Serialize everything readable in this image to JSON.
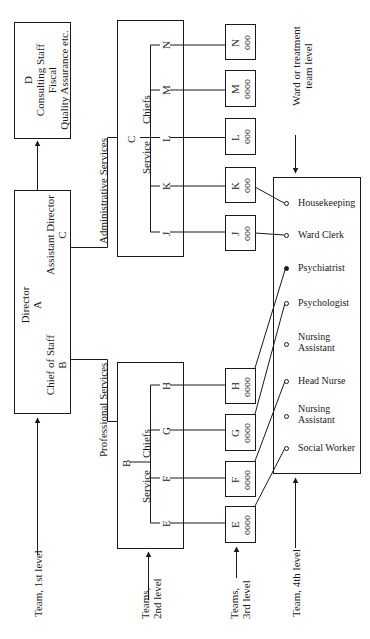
{
  "diagram": {
    "type": "organizational-chart",
    "orientation": "rotated -90deg (landscape)",
    "level_labels": {
      "team_1st": "Team, 1st level",
      "teams_2nd_line1": "Teams,",
      "teams_2nd_line2": "2nd level",
      "teams_3rd_line1": "Teams,",
      "teams_3rd_line2": "3rd level",
      "team_4th": "Team, 4th level",
      "ward_line1": "Ward or treatment",
      "ward_line2": "team level"
    },
    "top_box": {
      "director_label": "Director",
      "director_letter": "A",
      "assistant_label": "Assistant Director",
      "assistant_letter": "C",
      "chief_label": "Chief of Staff",
      "chief_letter": "B"
    },
    "staff_box": {
      "letter": "D",
      "line1": "Consulting Staff",
      "line2": "Fiscal",
      "line3": "Quality Assurance etc."
    },
    "admin_services": {
      "label": "Administrative Services",
      "root_letter": "C",
      "service_label": "Service",
      "chiefs_label": "Chiefs",
      "chiefs": [
        "J",
        "K",
        "L",
        "M",
        "N"
      ]
    },
    "prof_services": {
      "label": "Professional Services",
      "root_letter": "B",
      "service_label": "Service",
      "chiefs_label": "Chiefs",
      "chiefs": [
        "E",
        "F",
        "G",
        "H"
      ]
    },
    "teams_3rd": [
      {
        "letter": "N",
        "circles": "ooo"
      },
      {
        "letter": "M",
        "circles": "oooo"
      },
      {
        "letter": "L",
        "circles": "ooo"
      },
      {
        "letter": "K",
        "circles": "ooo"
      },
      {
        "letter": "J",
        "circles": "ooo"
      },
      {
        "letter": "H",
        "circles": "oooo"
      },
      {
        "letter": "G",
        "circles": "oooo"
      },
      {
        "letter": "F",
        "circles": "oooo"
      },
      {
        "letter": "E",
        "circles": "oooo"
      }
    ],
    "ward_team": [
      {
        "label": "Housekeeping",
        "filled": false,
        "linked_from": "K"
      },
      {
        "label": "Ward Clerk",
        "filled": false,
        "linked_from": "J"
      },
      {
        "label": "Psychiatrist",
        "filled": true,
        "linked_from": "H"
      },
      {
        "label": "Psychologist",
        "filled": false,
        "linked_from": "G"
      },
      {
        "label": "Nursing",
        "label2": "Assistant",
        "filled": false
      },
      {
        "label": "Head Nurse",
        "filled": false,
        "linked_from": "F"
      },
      {
        "label": "Nursing",
        "label2": "Assistant",
        "filled": false
      },
      {
        "label": "Social Worker",
        "filled": false,
        "linked_from": "E"
      }
    ]
  }
}
